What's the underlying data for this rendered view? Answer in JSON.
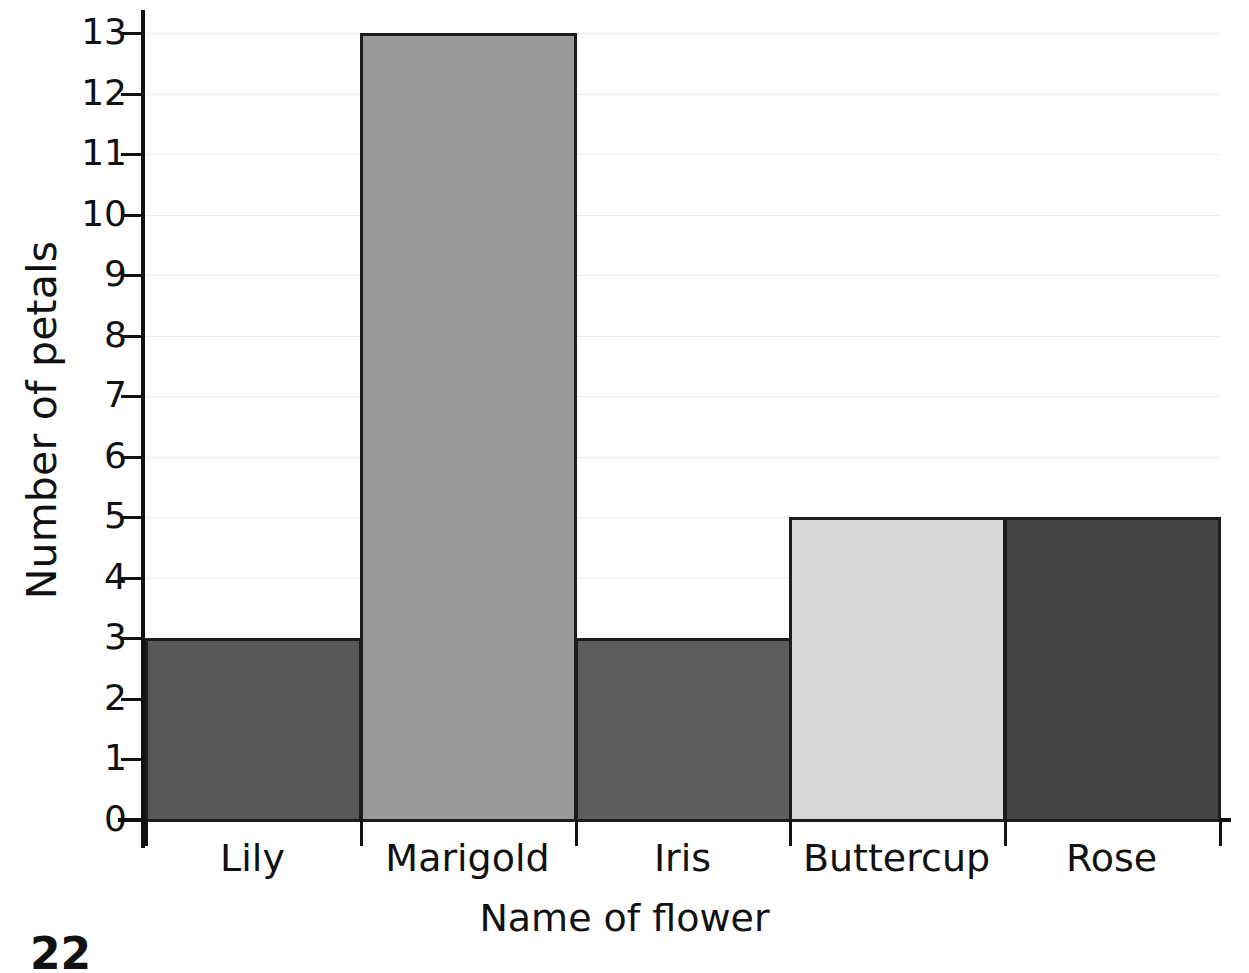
{
  "chart_data": {
    "type": "bar",
    "title": "",
    "categories": [
      "Lily",
      "Marigold",
      "Iris",
      "Buttercup",
      "Rose"
    ],
    "values": [
      3,
      13,
      3,
      5,
      5
    ],
    "series": [
      {
        "name": "Number of petals",
        "values": [
          3,
          13,
          3,
          5,
          5
        ]
      }
    ],
    "xlabel": "Name of flower",
    "ylabel": "Number of petals",
    "ylim": [
      0,
      13
    ],
    "ytick_labels": [
      "0",
      "1",
      "2",
      "3",
      "4",
      "5",
      "6",
      "7",
      "8",
      "9",
      "10",
      "11",
      "12",
      "13"
    ],
    "ytick_values": [
      0,
      1,
      2,
      3,
      4,
      5,
      6,
      7,
      8,
      9,
      10,
      11,
      12,
      13
    ],
    "grid": true,
    "legend": "none",
    "bar_gap": 0,
    "bar_colors": [
      "#585858",
      "#9a9a9a",
      "#5d5d5d",
      "#d7d7d7",
      "#454545"
    ],
    "bar_edge_color": "#1c1c1c",
    "grid_color": "#ececec",
    "axis_color": "#111111",
    "background": "#ffffff"
  },
  "page": {
    "number": "22"
  }
}
